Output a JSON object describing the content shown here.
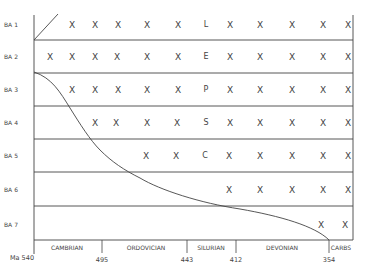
{
  "chart_data": {
    "type": "diagram",
    "title": "",
    "rows": [
      {
        "label": "BA 1",
        "y": 25,
        "cells": [
          {
            "x": 72,
            "t": "X"
          },
          {
            "x": 95,
            "t": "X"
          },
          {
            "x": 118,
            "t": "X"
          },
          {
            "x": 147,
            "t": "X"
          },
          {
            "x": 178,
            "t": "X"
          },
          {
            "x": 206,
            "t": "L",
            "letter": true
          },
          {
            "x": 230,
            "t": "X"
          },
          {
            "x": 260,
            "t": "X"
          },
          {
            "x": 292,
            "t": "X"
          },
          {
            "x": 323,
            "t": "X"
          },
          {
            "x": 348,
            "t": "X"
          }
        ]
      },
      {
        "label": "BA 2",
        "y": 57,
        "cells": [
          {
            "x": 50,
            "t": "X"
          },
          {
            "x": 72,
            "t": "X"
          },
          {
            "x": 95,
            "t": "X"
          },
          {
            "x": 117,
            "t": "X"
          },
          {
            "x": 147,
            "t": "X"
          },
          {
            "x": 178,
            "t": "X"
          },
          {
            "x": 206,
            "t": "E",
            "letter": true
          },
          {
            "x": 230,
            "t": "X"
          },
          {
            "x": 260,
            "t": "X"
          },
          {
            "x": 292,
            "t": "X"
          },
          {
            "x": 323,
            "t": "X"
          },
          {
            "x": 348,
            "t": "X"
          }
        ]
      },
      {
        "label": "BA 3",
        "y": 90,
        "cells": [
          {
            "x": 72,
            "t": "X"
          },
          {
            "x": 95,
            "t": "X"
          },
          {
            "x": 118,
            "t": "X"
          },
          {
            "x": 147,
            "t": "X"
          },
          {
            "x": 178,
            "t": "X"
          },
          {
            "x": 206,
            "t": "P",
            "letter": true
          },
          {
            "x": 230,
            "t": "X"
          },
          {
            "x": 260,
            "t": "X"
          },
          {
            "x": 292,
            "t": "X"
          },
          {
            "x": 323,
            "t": "X"
          },
          {
            "x": 348,
            "t": "X"
          }
        ]
      },
      {
        "label": "BA 4",
        "y": 123,
        "cells": [
          {
            "x": 95,
            "t": "X"
          },
          {
            "x": 116,
            "t": "X"
          },
          {
            "x": 147,
            "t": "X"
          },
          {
            "x": 177,
            "t": "X"
          },
          {
            "x": 206,
            "t": "S",
            "letter": true
          },
          {
            "x": 230,
            "t": "X"
          },
          {
            "x": 260,
            "t": "X"
          },
          {
            "x": 292,
            "t": "X"
          },
          {
            "x": 323,
            "t": "X"
          },
          {
            "x": 348,
            "t": "X"
          }
        ]
      },
      {
        "label": "BA 5",
        "y": 156,
        "cells": [
          {
            "x": 146,
            "t": "X"
          },
          {
            "x": 176,
            "t": "X"
          },
          {
            "x": 205,
            "t": "C",
            "letter": true
          },
          {
            "x": 229,
            "t": "X"
          },
          {
            "x": 260,
            "t": "X"
          },
          {
            "x": 292,
            "t": "X"
          },
          {
            "x": 323,
            "t": "X"
          },
          {
            "x": 348,
            "t": "X"
          }
        ]
      },
      {
        "label": "BA 6",
        "y": 190,
        "cells": [
          {
            "x": 229,
            "t": "X"
          },
          {
            "x": 260,
            "t": "X"
          },
          {
            "x": 292,
            "t": "X"
          },
          {
            "x": 323,
            "t": "X"
          },
          {
            "x": 348,
            "t": "X"
          }
        ]
      },
      {
        "label": "BA 7",
        "y": 225,
        "cells": [
          {
            "x": 321,
            "t": "X"
          },
          {
            "x": 345,
            "t": "X"
          }
        ]
      }
    ],
    "row_dividers_y": [
      40,
      73,
      106,
      139,
      172,
      206,
      240
    ],
    "periods": [
      {
        "name": "CAMBRIAN",
        "x": 67
      },
      {
        "name": "ORDOVICIAN",
        "x": 146
      },
      {
        "name": "SILURIAN",
        "x": 211
      },
      {
        "name": "DEVONIAN",
        "x": 282
      },
      {
        "name": "CARBS",
        "x": 341
      }
    ],
    "ticks": [
      {
        "label": "Ma  540",
        "x": 22,
        "line_x": 34
      },
      {
        "label": "495",
        "x": 102,
        "line_x": 102
      },
      {
        "label": "443",
        "x": 187,
        "line_x": 187
      },
      {
        "label": "412",
        "x": 236,
        "line_x": 236
      },
      {
        "label": "354",
        "x": 329,
        "line_x": 329
      }
    ],
    "axis_unit": "Ma"
  }
}
